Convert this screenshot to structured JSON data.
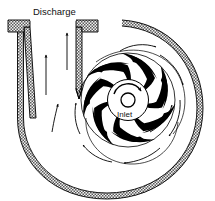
{
  "diagram": {
    "labels": {
      "discharge": "Discharge",
      "inlet": "Inlet"
    },
    "colors": {
      "line": "#000000",
      "wall_hatch_dark": "#555555",
      "wall_hatch_light": "#bfbfbf",
      "background": "#ffffff",
      "blade_fill": "#000000",
      "text": "#111111"
    },
    "components": [
      {
        "name": "volute-casing",
        "description": "Spiral volute casing wall, hatched cross-section"
      },
      {
        "name": "discharge-pipe",
        "description": "Vertical discharge nozzle with flange at top"
      },
      {
        "name": "discharge-flange",
        "description": "Flange at top of discharge pipe"
      },
      {
        "name": "cutwater-tongue",
        "description": "Volute tongue separating discharge from casing"
      },
      {
        "name": "impeller",
        "description": "Backward-curved vane impeller"
      },
      {
        "name": "impeller-hub",
        "description": "Central hub disc"
      },
      {
        "name": "inlet-eye",
        "description": "Suction eye opening at center"
      },
      {
        "name": "rotation-arrow",
        "description": "Curved arrow showing clockwise impeller rotation"
      }
    ],
    "impeller": {
      "blade_count": 7,
      "center_x": 128,
      "center_y": 100,
      "outer_radius": 47,
      "hub_radius": 20,
      "eye_radius": 7,
      "rotation": "clockwise"
    },
    "flow_arrows": {
      "discharge_pipe_count": 3,
      "volute_streamline_count": 8,
      "direction": "outward along volute toward discharge"
    }
  }
}
